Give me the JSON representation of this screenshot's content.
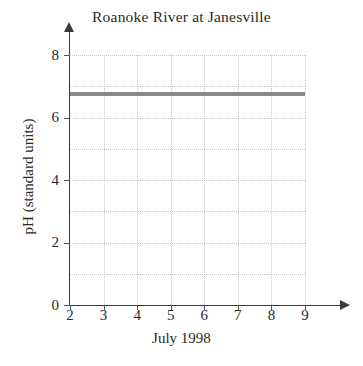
{
  "chart_data": {
    "type": "line",
    "title": "Roanoke River at Janesville",
    "xlabel": "July 1998",
    "ylabel": "pH (standard units)",
    "x": [
      2,
      3,
      4,
      5,
      6,
      7,
      8,
      9
    ],
    "series": [
      {
        "name": "pH",
        "values": [
          6.75,
          6.75,
          6.75,
          6.75,
          6.75,
          6.75,
          6.75,
          6.75
        ],
        "color": "#8a8a8a"
      }
    ],
    "xlim": [
      2,
      9
    ],
    "ylim": [
      0,
      8
    ],
    "xticks": [
      2,
      3,
      4,
      5,
      6,
      7,
      8,
      9
    ],
    "xtick_labels": [
      "2",
      "3",
      "4",
      "5",
      "6",
      "7",
      "8",
      "9"
    ],
    "yticks": [
      0,
      2,
      4,
      6,
      8
    ],
    "ytick_labels": [
      "0",
      "2",
      "4",
      "6",
      "8"
    ],
    "y_minor_gridlines": [
      1,
      2,
      3,
      4,
      5,
      6,
      7,
      8
    ],
    "x_minor_gridlines": [
      3,
      4,
      5,
      6,
      7,
      8,
      9
    ],
    "grid": true,
    "grid_color": "#c9c9c9",
    "grid_style": "dotted",
    "legend": false,
    "legend_position": "none",
    "axis_color": "#3a3a3a",
    "axis_arrows": true,
    "background": "#ffffff"
  }
}
